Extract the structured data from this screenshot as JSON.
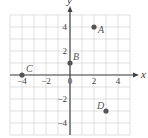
{
  "chart_data": {
    "type": "scatter",
    "title": "",
    "xlabel": "x",
    "ylabel": "y",
    "xlim": [
      -5,
      5
    ],
    "ylim": [
      -5,
      5
    ],
    "grid": true,
    "x_ticks": [
      "-4",
      "-2",
      "0",
      "2",
      "4"
    ],
    "y_ticks": [
      "4",
      "2",
      "-2",
      "-4"
    ],
    "points": [
      {
        "label": "A",
        "x": 2,
        "y": 4
      },
      {
        "label": "B",
        "x": 0,
        "y": 1
      },
      {
        "label": "C",
        "x": -4,
        "y": 0
      },
      {
        "label": "D",
        "x": 3,
        "y": -3
      }
    ]
  }
}
